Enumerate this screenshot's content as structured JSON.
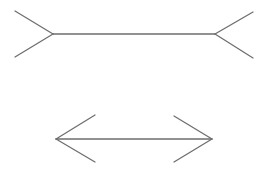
{
  "diagram": {
    "type": "muller-lyer-illusion",
    "background": "#ffffff",
    "line_color": "#6e6e6e",
    "figures": [
      {
        "name": "fins-out-figure",
        "shaft": [
          53,
          34,
          215,
          34
        ],
        "fins": [
          [
            53,
            34,
            15,
            11
          ],
          [
            53,
            34,
            15,
            57
          ],
          [
            215,
            34,
            253,
            12
          ],
          [
            215,
            34,
            253,
            58
          ]
        ]
      },
      {
        "name": "fins-in-figure",
        "shaft": [
          56,
          139,
          212,
          139
        ],
        "fins": [
          [
            56,
            139,
            95,
            115
          ],
          [
            56,
            139,
            95,
            162
          ],
          [
            212,
            139,
            174,
            116
          ],
          [
            212,
            139,
            174,
            162
          ]
        ]
      }
    ]
  }
}
